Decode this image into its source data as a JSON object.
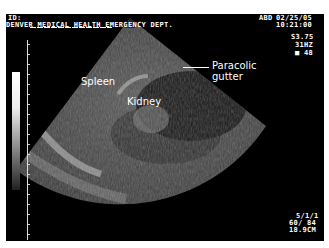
{
  "header": {
    "id_label": "ID:",
    "institution": "DENVER MEDICAL HEALTH EMERGENCY DEPT.",
    "preset": "ABD",
    "date": "02/25/05",
    "time": "10:21:00"
  },
  "params_top": {
    "probe": "S3.75",
    "frequency": "31HZ",
    "gain": "■ 48"
  },
  "params_bottom": {
    "line1": "5/1/1",
    "line2": "60/ 84",
    "depth": "18.9CM"
  },
  "annotations": {
    "spleen": "Spleen",
    "kidney": "Kidney",
    "paracolic_line1": "Paracolic",
    "paracolic_line2": "gutter"
  },
  "colors": {
    "background": "#000000",
    "frame": "#ffffff",
    "text": "#ffffff"
  }
}
